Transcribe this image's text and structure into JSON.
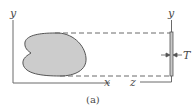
{
  "diagram": {
    "caption": "(a)",
    "labels": {
      "y_left": "y",
      "x_axis": "x",
      "y_right": "y",
      "z_axis": "z",
      "thickness": "T"
    },
    "colors": {
      "line": "#6a6a6a",
      "shape_fill": "#cccccc",
      "shape_stroke": "#555555",
      "plate_fill": "#c8c8c8",
      "background": "#ffffff"
    }
  }
}
